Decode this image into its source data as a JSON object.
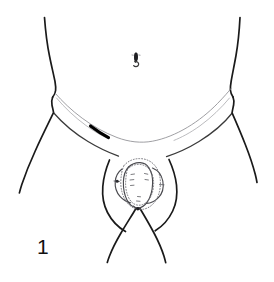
{
  "figure": {
    "number_label": "1",
    "caption": "",
    "background_color": "#ffffff",
    "ink_color": "#1a1a1a",
    "accent_dark_color": "#000000",
    "faint_color": "#8e8e92",
    "width_px": 274,
    "height_px": 282,
    "parts": {
      "left_flank_label": "left flank contour",
      "right_flank_label": "right flank contour",
      "left_inguinal_label": "left inguinal crease",
      "right_inguinal_label": "right inguinal crease",
      "abdominal_fold_label": "lower abdominal fold",
      "navel_label": "navel",
      "left_thigh_label": "left outer thigh contour",
      "right_thigh_label": "right outer thigh contour",
      "left_inner_thigh_label": "left inner thigh contour",
      "right_inner_thigh_label": "right inner thigh contour",
      "incision_mark_label": "dark incision mark",
      "genital_outline_label": "genital region outline",
      "genital_stipple_label": "stippled dissection border"
    }
  }
}
